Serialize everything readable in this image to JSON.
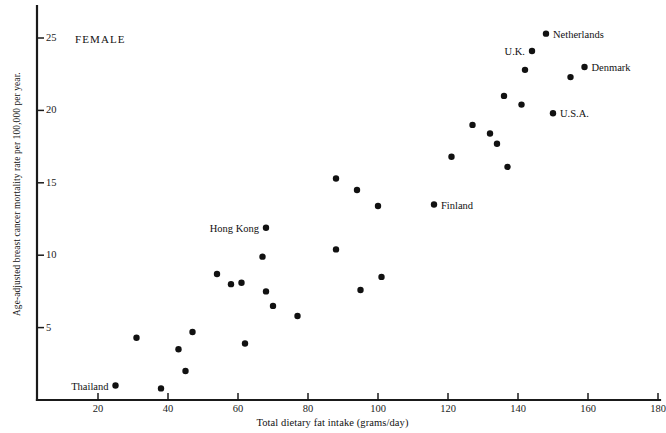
{
  "chart_data": {
    "type": "scatter",
    "title": "",
    "annotation_text": "FEMALE",
    "xlabel": "Total dietary fat intake (grams/day)",
    "ylabel": "Age-adjusted breast cancer  mortality rate  per 100,000 per year.",
    "xlim": [
      10,
      180
    ],
    "ylim": [
      0,
      27
    ],
    "xticks": [
      20,
      40,
      60,
      80,
      100,
      120,
      140,
      160,
      180
    ],
    "yticks": [
      5,
      10,
      15,
      20,
      25
    ],
    "grid": false,
    "legend": null,
    "marker": "filled-circle",
    "marker_color": "#111111",
    "points": [
      {
        "x": 25,
        "y": 1.0,
        "label": "Thailand",
        "label_side": "left"
      },
      {
        "x": 31,
        "y": 4.3,
        "label": null,
        "label_side": null
      },
      {
        "x": 38,
        "y": 0.8,
        "label": null,
        "label_side": null
      },
      {
        "x": 43,
        "y": 3.5,
        "label": null,
        "label_side": null
      },
      {
        "x": 45,
        "y": 2.0,
        "label": null,
        "label_side": null
      },
      {
        "x": 47,
        "y": 4.7,
        "label": null,
        "label_side": null
      },
      {
        "x": 54,
        "y": 8.7,
        "label": null,
        "label_side": null
      },
      {
        "x": 58,
        "y": 8.0,
        "label": null,
        "label_side": null
      },
      {
        "x": 61,
        "y": 8.1,
        "label": null,
        "label_side": null
      },
      {
        "x": 62,
        "y": 3.9,
        "label": null,
        "label_side": null
      },
      {
        "x": 67,
        "y": 9.9,
        "label": null,
        "label_side": null
      },
      {
        "x": 68,
        "y": 11.9,
        "label": "Hong Kong",
        "label_side": "left"
      },
      {
        "x": 68,
        "y": 7.5,
        "label": null,
        "label_side": null
      },
      {
        "x": 70,
        "y": 6.5,
        "label": null,
        "label_side": null
      },
      {
        "x": 77,
        "y": 5.8,
        "label": null,
        "label_side": null
      },
      {
        "x": 88,
        "y": 15.3,
        "label": null,
        "label_side": null
      },
      {
        "x": 88,
        "y": 10.4,
        "label": null,
        "label_side": null
      },
      {
        "x": 94,
        "y": 14.5,
        "label": null,
        "label_side": null
      },
      {
        "x": 95,
        "y": 7.6,
        "label": null,
        "label_side": null
      },
      {
        "x": 100,
        "y": 13.4,
        "label": null,
        "label_side": null
      },
      {
        "x": 101,
        "y": 8.5,
        "label": null,
        "label_side": null
      },
      {
        "x": 116,
        "y": 13.5,
        "label": "Finland",
        "label_side": "right"
      },
      {
        "x": 121,
        "y": 16.8,
        "label": null,
        "label_side": null
      },
      {
        "x": 127,
        "y": 19.0,
        "label": null,
        "label_side": null
      },
      {
        "x": 132,
        "y": 18.4,
        "label": null,
        "label_side": null
      },
      {
        "x": 134,
        "y": 17.7,
        "label": null,
        "label_side": null
      },
      {
        "x": 136,
        "y": 21.0,
        "label": null,
        "label_side": null
      },
      {
        "x": 137,
        "y": 16.1,
        "label": null,
        "label_side": null
      },
      {
        "x": 141,
        "y": 20.4,
        "label": null,
        "label_side": null
      },
      {
        "x": 142,
        "y": 22.8,
        "label": null,
        "label_side": null
      },
      {
        "x": 144,
        "y": 24.1,
        "label": "U.K.",
        "label_side": "left"
      },
      {
        "x": 148,
        "y": 25.3,
        "label": "Netherlands",
        "label_side": "right"
      },
      {
        "x": 150,
        "y": 19.8,
        "label": "U.S.A.",
        "label_side": "right"
      },
      {
        "x": 155,
        "y": 22.3,
        "label": null,
        "label_side": null
      },
      {
        "x": 159,
        "y": 23.0,
        "label": "Denmark",
        "label_side": "right"
      }
    ]
  }
}
